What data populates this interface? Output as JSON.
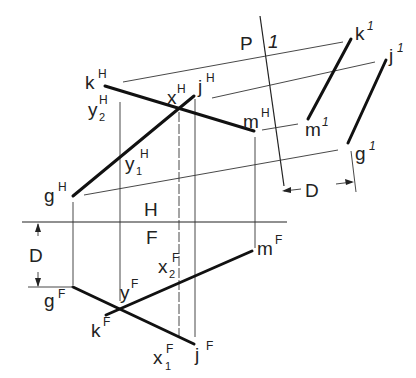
{
  "diagram": {
    "colors": {
      "ink": "#111111",
      "background": "#ffffff"
    },
    "folding_lines": [
      {
        "id": "HF",
        "upper_label": "H",
        "lower_label": "F"
      },
      {
        "id": "P1",
        "left_label": "P",
        "right_label": "1"
      }
    ],
    "labels": {
      "kH": {
        "base": "k",
        "sup": "H"
      },
      "jH": {
        "base": "j",
        "sup": "H"
      },
      "xH": {
        "base": "x",
        "sup": "H"
      },
      "y2H": {
        "base": "y",
        "sub": "2",
        "sup": "H"
      },
      "y1H": {
        "base": "y",
        "sub": "1",
        "sup": "H"
      },
      "mH": {
        "base": "m",
        "sup": "H"
      },
      "gH": {
        "base": "g",
        "sup": "H"
      },
      "gF": {
        "base": "g",
        "sup": "F"
      },
      "yF": {
        "base": "y",
        "sup": "F"
      },
      "x2F": {
        "base": "x",
        "sub": "2",
        "sup": "F"
      },
      "mF": {
        "base": "m",
        "sup": "F"
      },
      "kF": {
        "base": "k",
        "sup": "F"
      },
      "x1F": {
        "base": "x",
        "sub": "1",
        "sup": "F"
      },
      "jF": {
        "base": "j",
        "sup": "F"
      },
      "k1": {
        "base": "k",
        "sup": "1"
      },
      "j1": {
        "base": "j",
        "sup": "1"
      },
      "m1": {
        "base": "m",
        "sup": "1"
      },
      "g1": {
        "base": "g",
        "sup": "1"
      }
    },
    "dimensions": [
      {
        "id": "D_front",
        "label": "D",
        "view": "front"
      },
      {
        "id": "D_aux",
        "label": "D",
        "view": "auxiliary"
      }
    ]
  }
}
